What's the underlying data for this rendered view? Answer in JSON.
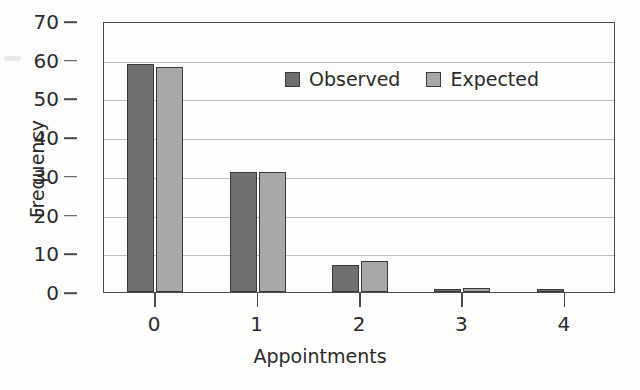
{
  "chart_data": {
    "type": "bar",
    "title": "",
    "xlabel": "Appointments",
    "ylabel": "Frequency",
    "categories": [
      "0",
      "1",
      "2",
      "3",
      "4"
    ],
    "series": [
      {
        "name": "Observed",
        "values": [
          59,
          31,
          7,
          0.3,
          0.3
        ],
        "color": "#6e6e6e"
      },
      {
        "name": "Expected",
        "values": [
          58,
          31,
          8,
          1,
          0
        ]
      }
    ],
    "ylim": [
      0,
      70
    ],
    "yticks": [
      0,
      10,
      20,
      30,
      40,
      50,
      60,
      70
    ],
    "grid": "horizontal",
    "legend_position": "upper-center-right"
  },
  "colors": {
    "observed": "#6e6e6e",
    "expected": "#a8a8a8",
    "outline": "#3a3a3a",
    "axis": "#4a4a4a",
    "gridline": "#bdbdbd",
    "text": "#2b2b2b",
    "background": "#fdfdfc"
  }
}
